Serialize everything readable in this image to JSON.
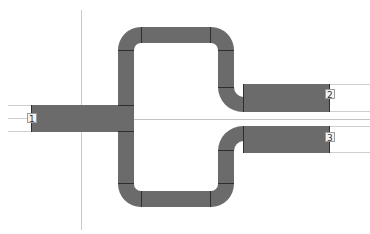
{
  "diagram": {
    "type": "microstrip-layout",
    "colors": {
      "trace_fill": "#6b6b6b",
      "trace_edge": "#3c3c3c",
      "segment_divider": "#2f2f2f",
      "reference_line": "#cfcfcf",
      "guide_line": "#c8c8c8",
      "background": "#ffffff"
    },
    "ports": [
      {
        "id": "port-1",
        "label": "1",
        "side": "left"
      },
      {
        "id": "port-2",
        "label": "2",
        "side": "right-upper"
      },
      {
        "id": "port-3",
        "label": "3",
        "side": "right-lower"
      }
    ]
  }
}
